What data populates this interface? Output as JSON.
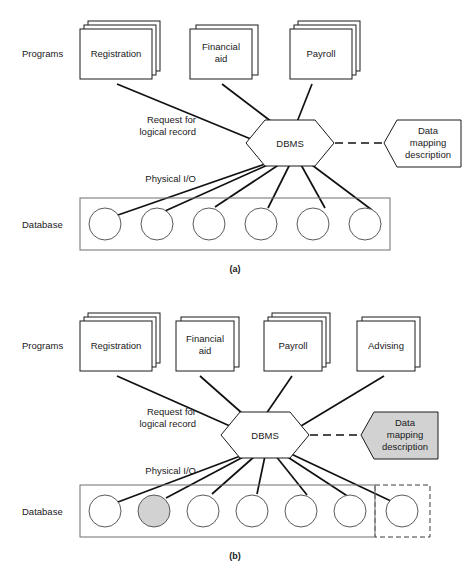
{
  "figure": {
    "colors": {
      "line": "#111111",
      "box_stroke": "#1a1a1a",
      "db_box_stroke": "#6e6e6e",
      "circle_stroke": "#5a5a5a",
      "shaded_fill": "#d2d2d2",
      "white_fill": "#ffffff",
      "text": "#1a1a1a"
    }
  },
  "panels": [
    {
      "id": "panel-a",
      "caption": "(a)",
      "side_labels": {
        "programs": "Programs",
        "database": "Database"
      },
      "edge_labels": {
        "request": "Request for",
        "request_line2": "logical record",
        "physical_io": "Physical I/O"
      },
      "hub": {
        "label": "DBMS"
      },
      "mapping_box": {
        "line1": "Data",
        "line2": "mapping",
        "line3": "description",
        "shaded": false,
        "fill": "#ffffff"
      },
      "programs": [
        {
          "label": "Registration",
          "sheets": 3
        },
        {
          "label": "Financial",
          "label2": "aid",
          "sheets": 2
        },
        {
          "label": "Payroll",
          "sheets": 3
        }
      ],
      "database": {
        "record_count": 6,
        "shaded_index": null,
        "has_dashed_extension": false,
        "extension_record_count": 0
      }
    },
    {
      "id": "panel-b",
      "caption": "(b)",
      "side_labels": {
        "programs": "Programs",
        "database": "Database"
      },
      "edge_labels": {
        "request": "Request for",
        "request_line2": "logical record",
        "physical_io": "Physical I/O"
      },
      "hub": {
        "label": "DBMS"
      },
      "mapping_box": {
        "line1": "Data",
        "line2": "mapping",
        "line3": "description",
        "shaded": true,
        "fill": "#d2d2d2"
      },
      "programs": [
        {
          "label": "Registration",
          "sheets": 3
        },
        {
          "label": "Financial",
          "label2": "aid",
          "sheets": 2
        },
        {
          "label": "Payroll",
          "sheets": 3
        },
        {
          "label": "Advising",
          "sheets": 2
        }
      ],
      "database": {
        "record_count": 6,
        "shaded_index": 1,
        "has_dashed_extension": true,
        "extension_record_count": 1
      }
    }
  ]
}
